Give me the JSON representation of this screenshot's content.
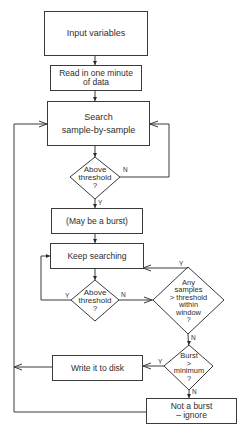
{
  "flowchart": {
    "nodes": {
      "input_variables": {
        "lines": [
          "Input variables"
        ]
      },
      "read_data": {
        "lines": [
          "Read in one minute",
          "of data"
        ]
      },
      "search": {
        "lines": [
          "Search",
          "sample-by-sample"
        ]
      },
      "above_threshold_1": {
        "lines": [
          "Above",
          "threshold",
          "?"
        ]
      },
      "may_be_burst": {
        "lines": [
          "(May be a burst)"
        ]
      },
      "keep_searching": {
        "lines": [
          "Keep searching"
        ]
      },
      "above_threshold_2": {
        "lines": [
          "Above",
          "threshold",
          "?"
        ]
      },
      "any_samples": {
        "lines": [
          "Any",
          "samples",
          "> threshold",
          "within",
          "window",
          "?"
        ]
      },
      "burst_minimum": {
        "lines": [
          "Burst",
          ">",
          "minimum",
          "?"
        ]
      },
      "write_disk": {
        "lines": [
          "Write it to disk"
        ]
      },
      "not_burst": {
        "lines": [
          "Not a burst",
          "– ignore"
        ]
      }
    },
    "edge_labels": {
      "at1_no": "N",
      "at1_yes": "Y",
      "at2_yes": "Y",
      "at2_no": "N",
      "any_yes": "Y",
      "any_no": "N",
      "burst_yes": "Y",
      "burst_no": "N"
    },
    "colors": {
      "line": "#3a3a3a",
      "text": "#2e2e2e",
      "background": "#ffffff"
    }
  }
}
